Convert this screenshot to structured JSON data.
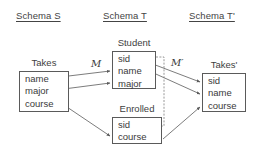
{
  "headers": {
    "source": "Schema S",
    "target": "Schema T",
    "target_prime": "Schema T'"
  },
  "mappings": {
    "m": "M",
    "m_prime": "M′"
  },
  "entities": [
    {
      "id": "takes",
      "schema": "Schema S",
      "title": "Takes",
      "attributes": [
        "name",
        "major",
        "course"
      ]
    },
    {
      "id": "student",
      "schema": "Schema T",
      "title": "Student",
      "attributes": [
        "sid",
        "name",
        "major"
      ]
    },
    {
      "id": "enrolled",
      "schema": "Schema T",
      "title": "Enrolled",
      "attributes": [
        "sid",
        "course"
      ]
    },
    {
      "id": "takes_prime",
      "schema": "Schema T'",
      "title": "Takes'",
      "attributes": [
        "sid",
        "name",
        "course"
      ]
    }
  ],
  "edges": [
    {
      "from": "takes.name",
      "to": "student.name",
      "style": "solid-arrow",
      "mapping": "M"
    },
    {
      "from": "takes.major",
      "to": "student.major",
      "style": "solid-arrow",
      "mapping": "M"
    },
    {
      "from": "takes.course",
      "to": "enrolled.course",
      "style": "solid-arrow",
      "mapping": "M"
    },
    {
      "from": "student.sid",
      "to": "takes_prime.sid",
      "style": "solid-arrow",
      "mapping": "M′"
    },
    {
      "from": "student.name",
      "to": "takes_prime.name",
      "style": "solid-arrow",
      "mapping": "M′"
    },
    {
      "from": "enrolled.course",
      "to": "takes_prime.course",
      "style": "solid-arrow",
      "mapping": "M′"
    },
    {
      "from": "student.sid",
      "to": "enrolled.sid",
      "style": "dotted",
      "mapping": ""
    }
  ],
  "colors": {
    "line": "#5a5a5a",
    "text": "#3a3a3a",
    "background": "#ffffff"
  }
}
